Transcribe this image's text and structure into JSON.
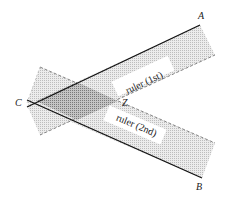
{
  "diagram": {
    "points": {
      "A": {
        "label": "A"
      },
      "B": {
        "label": "B"
      },
      "C": {
        "label": "C"
      },
      "Z": {
        "label": "Z"
      }
    },
    "rulers": [
      {
        "label": "ruler (1st)"
      },
      {
        "label": "ruler (2nd)"
      }
    ],
    "colors": {
      "ruler_fill": "#d9d9d9",
      "overlap_fill": "#a6a6a6",
      "line": "#111111",
      "label_bg": "#ffffff"
    }
  }
}
